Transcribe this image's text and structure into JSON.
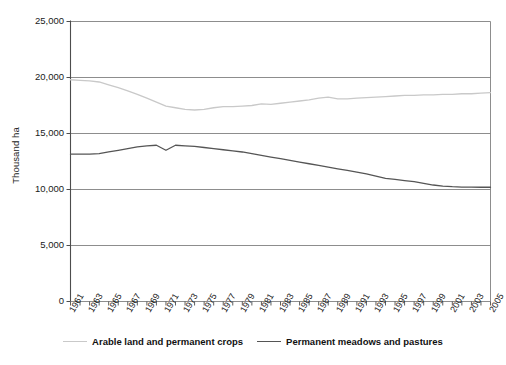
{
  "chart_data": {
    "type": "line",
    "title": "",
    "subtitle": "",
    "xlabel": "",
    "ylabel": "Thousand ha",
    "xlim": [
      1961,
      2005
    ],
    "ylim": [
      0,
      25000
    ],
    "ytick_values": [
      0,
      5000,
      10000,
      15000,
      20000,
      25000
    ],
    "ytick_labels": [
      "0",
      "5,000",
      "10,000",
      "15,000",
      "20,000",
      "25,000"
    ],
    "x": [
      1961,
      1962,
      1963,
      1964,
      1965,
      1966,
      1967,
      1968,
      1969,
      1970,
      1971,
      1972,
      1973,
      1974,
      1975,
      1976,
      1977,
      1978,
      1979,
      1980,
      1981,
      1982,
      1983,
      1984,
      1985,
      1986,
      1987,
      1988,
      1989,
      1990,
      1991,
      1992,
      1993,
      1994,
      1995,
      1996,
      1997,
      1998,
      1999,
      2000,
      2001,
      2002,
      2003,
      2004,
      2005
    ],
    "xtick_labels": [
      "1961",
      "1963",
      "1965",
      "1967",
      "1969",
      "1971",
      "1973",
      "1975",
      "1977",
      "1979",
      "1981",
      "1983",
      "1985",
      "1987",
      "1989",
      "1991",
      "1993",
      "1995",
      "1997",
      "1999",
      "2001",
      "2003",
      "2005"
    ],
    "grid": true,
    "legend_position": "bottom",
    "series": [
      {
        "name": "Arable land and permanent crops",
        "color": "#c9c9c9",
        "values": [
          19800,
          19750,
          19700,
          19600,
          19350,
          19100,
          18800,
          18500,
          18150,
          17800,
          17450,
          17300,
          17150,
          17100,
          17150,
          17300,
          17400,
          17400,
          17450,
          17500,
          17650,
          17600,
          17700,
          17800,
          17900,
          18000,
          18150,
          18250,
          18100,
          18100,
          18150,
          18200,
          18250,
          18300,
          18350,
          18400,
          18400,
          18450,
          18450,
          18500,
          18500,
          18550,
          18550,
          18600,
          18650
        ]
      },
      {
        "name": "Permanent meadows and pastures",
        "color": "#555555",
        "values": [
          13150,
          13150,
          13150,
          13200,
          13350,
          13500,
          13650,
          13800,
          13900,
          13950,
          13500,
          13950,
          13900,
          13850,
          13750,
          13650,
          13550,
          13450,
          13350,
          13200,
          13050,
          12900,
          12750,
          12600,
          12450,
          12300,
          12150,
          12000,
          11850,
          11700,
          11550,
          11400,
          11200,
          11000,
          10900,
          10800,
          10700,
          10550,
          10400,
          10300,
          10250,
          10220,
          10210,
          10200,
          10200
        ]
      }
    ]
  },
  "legend": {
    "items": [
      {
        "label": "Arable land and permanent crops",
        "color": "#c9c9c9"
      },
      {
        "label": "Permanent meadows and pastures",
        "color": "#555555"
      }
    ]
  },
  "axes": {
    "y_title": "Thousand ha"
  }
}
